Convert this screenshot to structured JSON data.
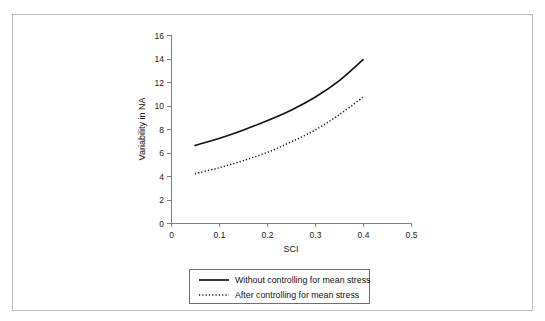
{
  "figure": {
    "frame_color": "#b9b9b9",
    "background": "#ffffff"
  },
  "chart_data": {
    "type": "line",
    "title": "",
    "subtitle": "",
    "xlabel": "SCI",
    "ylabel": "Variability in NA",
    "xlim": [
      0,
      0.5
    ],
    "ylim": [
      0,
      16
    ],
    "xticks": [
      "0",
      "0.1",
      "0.2",
      "0.3",
      "0.4",
      "0.5"
    ],
    "xtick_values": [
      0,
      0.1,
      0.2,
      0.3,
      0.4,
      0.5
    ],
    "yticks": [
      "0",
      "2",
      "4",
      "6",
      "8",
      "10",
      "12",
      "14",
      "16"
    ],
    "ytick_values": [
      0,
      2,
      4,
      6,
      8,
      10,
      12,
      14,
      16
    ],
    "grid": false,
    "legend_position": "below-axis",
    "series": [
      {
        "name": "Without controlling for mean stress",
        "style": "solid",
        "color": "#111111",
        "x": [
          0.05,
          0.1,
          0.15,
          0.2,
          0.25,
          0.3,
          0.35,
          0.4
        ],
        "values": [
          6.6,
          7.2,
          7.9,
          8.7,
          9.6,
          10.7,
          12.1,
          13.9
        ]
      },
      {
        "name": "After controlling for mean stress",
        "style": "dotted",
        "color": "#111111",
        "x": [
          0.05,
          0.1,
          0.15,
          0.2,
          0.25,
          0.3,
          0.35,
          0.4
        ],
        "values": [
          4.2,
          4.7,
          5.3,
          6.0,
          6.9,
          7.9,
          9.2,
          10.7
        ]
      }
    ]
  },
  "legend": {
    "entries": [
      {
        "label": "Without controlling for mean stress",
        "style": "solid"
      },
      {
        "label": "After controlling for mean stress",
        "style": "dotted"
      }
    ]
  }
}
